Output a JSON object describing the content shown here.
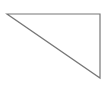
{
  "canvas": {
    "width": 106,
    "height": 96,
    "background": "#ffffff"
  },
  "shape": {
    "type": "right-triangle",
    "stroke": "#777777",
    "stroke_width": 1.2,
    "fill": "none",
    "points": [
      [
        7,
        14
      ],
      [
        100,
        14
      ],
      [
        100,
        78
      ]
    ]
  }
}
